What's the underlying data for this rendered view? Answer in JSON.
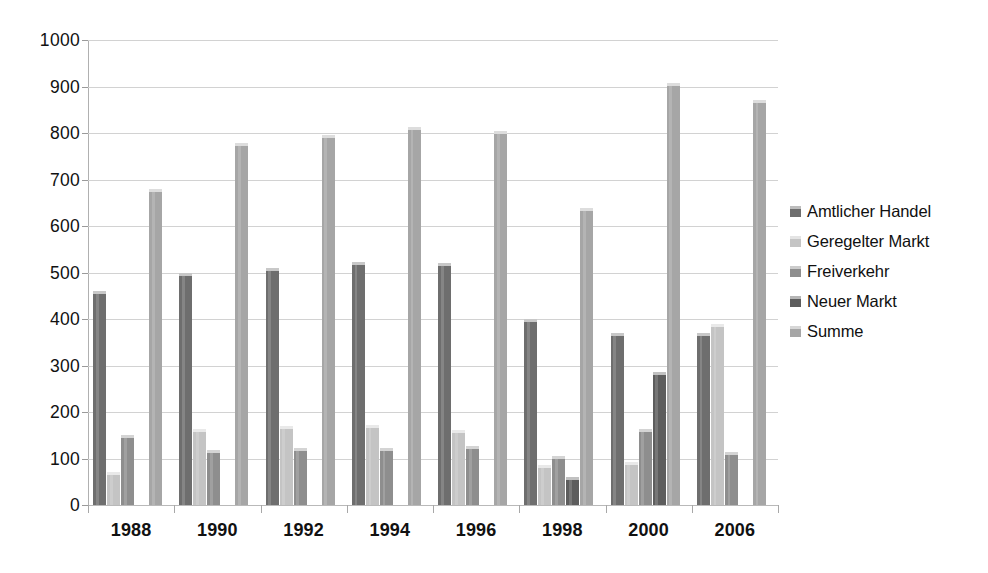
{
  "chart_data": {
    "type": "bar",
    "title": "",
    "subtitle": "",
    "xlabel": "",
    "ylabel": "",
    "ylim": [
      0,
      1000
    ],
    "ytick_step": 100,
    "yticks": [
      "1000",
      "900",
      "800",
      "700",
      "600",
      "500",
      "400",
      "300",
      "200",
      "100",
      "0"
    ],
    "ytick_values": [
      1000,
      900,
      800,
      700,
      600,
      500,
      400,
      300,
      200,
      100,
      0
    ],
    "grid": true,
    "legend_position": "right",
    "categories": [
      "1988",
      "1990",
      "1992",
      "1994",
      "1996",
      "1998",
      "2000",
      "2006"
    ],
    "series": [
      {
        "name": "Amtlicher Handel",
        "color": "#6e6e6e",
        "values": [
          460,
          500,
          510,
          523,
          521,
          400,
          370,
          370
        ]
      },
      {
        "name": "Geregelter Markt",
        "color": "#c4c4c4",
        "values": [
          70,
          163,
          170,
          172,
          162,
          85,
          93,
          390
        ]
      },
      {
        "name": "Freiverkehr",
        "color": "#8e8e8e",
        "values": [
          150,
          118,
          122,
          122,
          126,
          105,
          163,
          115
        ]
      },
      {
        "name": "Neuer Markt",
        "color": "#5d5d5d",
        "values": [
          0,
          0,
          0,
          0,
          0,
          60,
          285,
          0
        ]
      },
      {
        "name": "Summe",
        "color": "#a6a6a6",
        "values": [
          680,
          778,
          795,
          812,
          805,
          638,
          908,
          870
        ]
      }
    ]
  },
  "legend": {
    "items": [
      {
        "label": "Amtlicher Handel",
        "color": "#6e6e6e"
      },
      {
        "label": "Geregelter Markt",
        "color": "#c4c4c4"
      },
      {
        "label": "Freiverkehr",
        "color": "#8e8e8e"
      },
      {
        "label": "Neuer Markt",
        "color": "#5d5d5d"
      },
      {
        "label": "Summe",
        "color": "#a6a6a6"
      }
    ]
  },
  "axes": {
    "y_tick_labels": [
      "1000",
      "900",
      "800",
      "700",
      "600",
      "500",
      "400",
      "300",
      "200",
      "100",
      "0"
    ],
    "x_tick_labels": [
      "1988",
      "1990",
      "1992",
      "1994",
      "1996",
      "1998",
      "2000",
      "2006"
    ]
  }
}
